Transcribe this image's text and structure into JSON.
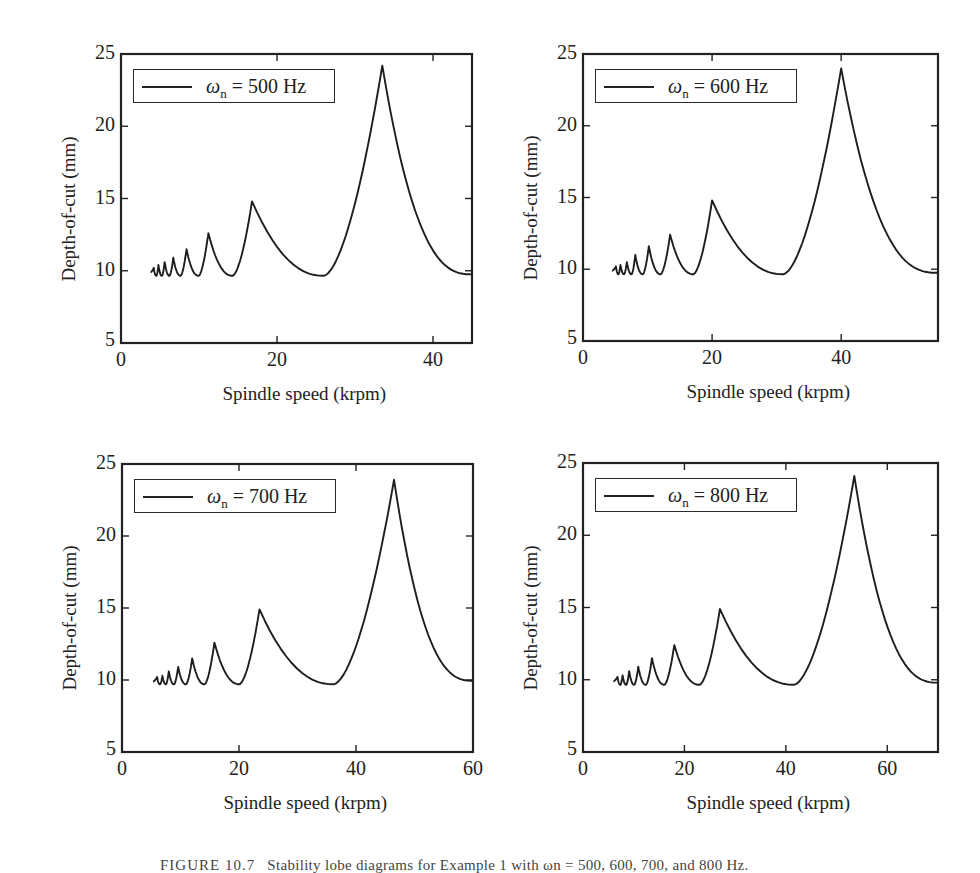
{
  "figure": {
    "caption_label": "FIGURE 10.7",
    "caption_text": "Stability lobe diagrams for Example 1 with ωn = 500, 600, 700, and 800 Hz."
  },
  "style": {
    "line_color": "#1e1e1e",
    "axis_color": "#222222",
    "background": "#ffffff"
  },
  "chart_data": [
    {
      "type": "line",
      "title": "",
      "legend": [
        "ωn = 500 Hz"
      ],
      "legend_symbol": "ω",
      "legend_sub": "n",
      "legend_value": "= 500 Hz",
      "xlabel": "Spindle speed (krpm)",
      "ylabel": "Depth-of-cut (mm)",
      "xlim": [
        0,
        45
      ],
      "ylim": [
        5,
        25
      ],
      "xticks": [
        0,
        20,
        40
      ],
      "yticks": [
        5,
        10,
        15,
        20,
        25
      ],
      "grid": false,
      "legend_position": "upper left",
      "x_start": 3.8,
      "baseline_min": 9.65,
      "peaks": [
        {
          "x": 33.5,
          "y": 24.2
        },
        {
          "x": 16.8,
          "y": 14.8
        },
        {
          "x": 11.2,
          "y": 12.6
        },
        {
          "x": 8.4,
          "y": 11.5
        },
        {
          "x": 6.7,
          "y": 10.9
        },
        {
          "x": 5.6,
          "y": 10.6
        },
        {
          "x": 4.8,
          "y": 10.4
        },
        {
          "x": 4.2,
          "y": 10.2
        }
      ],
      "end_value": 9.75
    },
    {
      "type": "line",
      "title": "",
      "legend": [
        "ωn = 600 Hz"
      ],
      "legend_symbol": "ω",
      "legend_sub": "n",
      "legend_value": "= 600 Hz",
      "xlabel": "Spindle speed (krpm)",
      "ylabel": "Depth-of-cut (mm)",
      "xlim": [
        0,
        55
      ],
      "ylim": [
        5,
        25
      ],
      "xticks": [
        0,
        20,
        40
      ],
      "yticks": [
        5,
        10,
        15,
        20,
        25
      ],
      "grid": false,
      "legend_position": "upper left",
      "x_start": 4.5,
      "baseline_min": 9.65,
      "peaks": [
        {
          "x": 40.0,
          "y": 24.0
        },
        {
          "x": 20.0,
          "y": 14.8
        },
        {
          "x": 13.5,
          "y": 12.4
        },
        {
          "x": 10.2,
          "y": 11.6
        },
        {
          "x": 8.1,
          "y": 11.0
        },
        {
          "x": 6.8,
          "y": 10.5
        },
        {
          "x": 5.8,
          "y": 10.3
        },
        {
          "x": 5.1,
          "y": 10.2
        }
      ],
      "end_value": 9.75
    },
    {
      "type": "line",
      "title": "",
      "legend": [
        "ωn = 700 Hz"
      ],
      "legend_symbol": "ω",
      "legend_sub": "n",
      "legend_value": "= 700 Hz",
      "xlabel": "Spindle speed (krpm)",
      "ylabel": "Depth-of-cut (mm)",
      "xlim": [
        0,
        60
      ],
      "ylim": [
        5,
        25
      ],
      "xticks": [
        0,
        20,
        40,
        60
      ],
      "yticks": [
        5,
        10,
        15,
        20,
        25
      ],
      "grid": false,
      "legend_position": "upper left",
      "x_start": 5.3,
      "baseline_min": 9.7,
      "peaks": [
        {
          "x": 46.5,
          "y": 23.9
        },
        {
          "x": 23.5,
          "y": 14.9
        },
        {
          "x": 15.8,
          "y": 12.6
        },
        {
          "x": 12.0,
          "y": 11.5
        },
        {
          "x": 9.6,
          "y": 10.9
        },
        {
          "x": 8.0,
          "y": 10.6
        },
        {
          "x": 6.9,
          "y": 10.3
        },
        {
          "x": 6.0,
          "y": 10.2
        }
      ],
      "end_value": 9.95
    },
    {
      "type": "line",
      "title": "",
      "legend": [
        "ωn = 800 Hz"
      ],
      "legend_symbol": "ω",
      "legend_sub": "n",
      "legend_value": "= 800 Hz",
      "xlabel": "Spindle speed (krpm)",
      "ylabel": "Depth-of-cut (mm)",
      "xlim": [
        0,
        70
      ],
      "ylim": [
        5,
        25
      ],
      "xticks": [
        0,
        20,
        40,
        60
      ],
      "yticks": [
        5,
        10,
        15,
        20,
        25
      ],
      "grid": false,
      "legend_position": "upper left",
      "x_start": 6.0,
      "baseline_min": 9.65,
      "peaks": [
        {
          "x": 53.5,
          "y": 24.1
        },
        {
          "x": 27.0,
          "y": 14.9
        },
        {
          "x": 18.0,
          "y": 12.4
        },
        {
          "x": 13.6,
          "y": 11.5
        },
        {
          "x": 10.9,
          "y": 10.9
        },
        {
          "x": 9.1,
          "y": 10.6
        },
        {
          "x": 7.8,
          "y": 10.3
        },
        {
          "x": 6.8,
          "y": 10.2
        }
      ],
      "end_value": 9.8
    }
  ]
}
